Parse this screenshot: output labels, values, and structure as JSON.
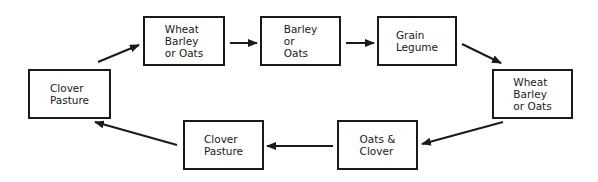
{
  "diagram": {
    "type": "crop-rotation-cycle",
    "nodes": [
      {
        "id": "n1",
        "label": "Wheat\nBarley\nor Oats",
        "x": 143,
        "y": 16,
        "w": 82,
        "h": 50
      },
      {
        "id": "n2",
        "label": "Barley\nor\nOats",
        "x": 260,
        "y": 16,
        "w": 81,
        "h": 50
      },
      {
        "id": "n3",
        "label": "Grain\nLegume",
        "x": 377,
        "y": 16,
        "w": 80,
        "h": 50
      },
      {
        "id": "n4",
        "label": "Wheat\nBarley\nor Oats",
        "x": 492,
        "y": 69,
        "w": 81,
        "h": 50
      },
      {
        "id": "n5",
        "label": "Oats &\nClover",
        "x": 337,
        "y": 120,
        "w": 81,
        "h": 50
      },
      {
        "id": "n6",
        "label": "Clover\nPasture",
        "x": 183,
        "y": 120,
        "w": 81,
        "h": 50
      },
      {
        "id": "n7",
        "label": "Clover\nPasture",
        "x": 28,
        "y": 69,
        "w": 83,
        "h": 50
      }
    ],
    "edges": [
      {
        "from": "n7",
        "to": "n1",
        "x1": 98,
        "y1": 62,
        "x2": 139,
        "y2": 45
      },
      {
        "from": "n1",
        "to": "n2",
        "x1": 230,
        "y1": 43,
        "x2": 257,
        "y2": 43
      },
      {
        "from": "n2",
        "to": "n3",
        "x1": 346,
        "y1": 43,
        "x2": 374,
        "y2": 43
      },
      {
        "from": "n3",
        "to": "n4",
        "x1": 462,
        "y1": 44,
        "x2": 501,
        "y2": 63
      },
      {
        "from": "n4",
        "to": "n5",
        "x1": 503,
        "y1": 122,
        "x2": 422,
        "y2": 144
      },
      {
        "from": "n5",
        "to": "n6",
        "x1": 333,
        "y1": 146,
        "x2": 267,
        "y2": 146
      },
      {
        "from": "n6",
        "to": "n7",
        "x1": 177,
        "y1": 145,
        "x2": 95,
        "y2": 122
      }
    ],
    "colors": {
      "stroke": "#1a1a1a",
      "background": "#ffffff"
    }
  }
}
